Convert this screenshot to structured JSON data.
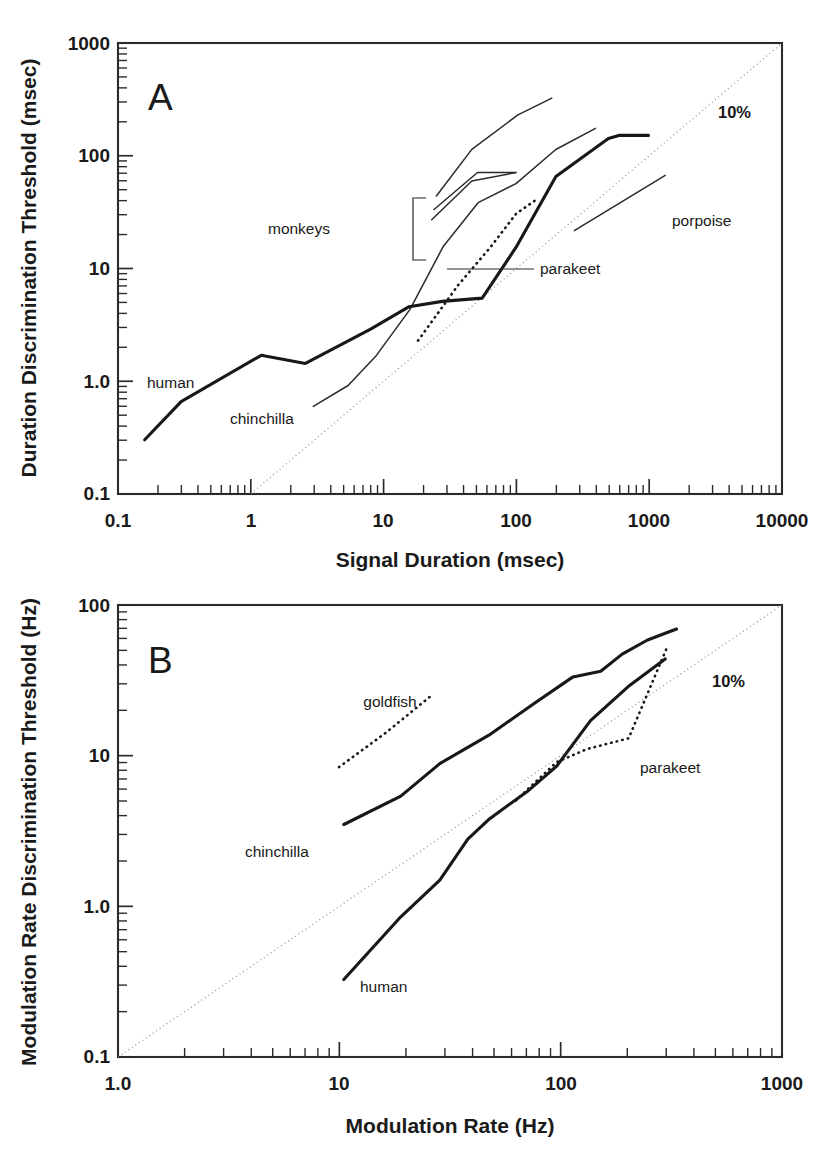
{
  "figure": {
    "name": "duration-and-modulation-rate-discrimination-figure",
    "background": "#ffffff",
    "ink_color": "#181818",
    "grid_color": "#909090"
  },
  "panels": [
    {
      "id": "A",
      "letter": "A",
      "pct_label": "10%"
    },
    {
      "id": "B",
      "letter": "B",
      "pct_label": "10%"
    }
  ],
  "chart_data": [
    {
      "type": "line",
      "id": "panel-a",
      "panel": "A",
      "title": "",
      "xlabel": "Signal Duration (msec)",
      "ylabel": "Duration Discrimination Threshold (msec)",
      "xscale": "log",
      "yscale": "log",
      "xlim": [
        0.1,
        10000
      ],
      "ylim": [
        0.1,
        1000
      ],
      "xticks": [
        0.1,
        1,
        10,
        100,
        1000,
        10000
      ],
      "xticklabels": [
        "0.1",
        "1",
        "10",
        "100",
        "1000",
        "10000"
      ],
      "yticks": [
        0.1,
        1.0,
        10,
        100,
        1000
      ],
      "yticklabels": [
        "0.1",
        "1.0",
        "10",
        "100",
        "1000"
      ],
      "grid": false,
      "legend": "inline-annotations",
      "reference_line": {
        "label": "10%",
        "description": "diagonal 10% Weber fraction reference line",
        "style": "dotted",
        "points": [
          [
            1,
            0.1
          ],
          [
            10000,
            1000
          ]
        ]
      },
      "series": [
        {
          "name": "human",
          "style": "solid-thick",
          "label": "human",
          "points": [
            [
              0.16,
              0.4
            ],
            [
              0.3,
              0.74
            ],
            [
              1.2,
              1.55
            ],
            [
              2.6,
              1.35
            ],
            [
              8,
              2.3
            ],
            [
              17,
              3.4
            ],
            [
              30,
              3.7
            ],
            [
              60,
              3.9
            ],
            [
              100,
              8.5
            ],
            [
              200,
              26
            ],
            [
              500,
              52
            ],
            [
              600,
              55
            ],
            [
              1000,
              55
            ]
          ]
        },
        {
          "name": "chinchilla",
          "style": "solid-thin",
          "label": "chinchilla",
          "points": [
            [
              3.0,
              0.66
            ],
            [
              5.5,
              0.95
            ],
            [
              9,
              1.6
            ],
            [
              17,
              3.4
            ],
            [
              30,
              9.0
            ],
            [
              55,
              22
            ],
            [
              100,
              31
            ],
            [
              200,
              62
            ],
            [
              400,
              95
            ]
          ]
        },
        {
          "name": "monkeys",
          "style": "solid-thin",
          "label": "monkeys",
          "description": "three monkey curves grouped by a bracket",
          "curves": [
            {
              "points": [
                [
                  26,
                  14
                ],
                [
                  55,
                  31
                ],
                [
                  100,
                  31
                ]
              ]
            },
            {
              "points": [
                [
                  25,
                  11.5
                ],
                [
                  50,
                  26
                ],
                [
                  100,
                  31
                ]
              ]
            },
            {
              "points": [
                [
                  27,
                  18
                ],
                [
                  50,
                  46
                ],
                [
                  110,
                  88
                ],
                [
                  200,
                  125
                ]
              ]
            }
          ]
        },
        {
          "name": "parakeet",
          "style": "dotted",
          "label": "parakeet",
          "points": [
            [
              20,
              2.4
            ],
            [
              40,
              6.5
            ],
            [
              70,
              14
            ],
            [
              110,
              25
            ],
            [
              160,
              34
            ]
          ]
        },
        {
          "name": "porpoise",
          "style": "solid-thin",
          "label": "porpoise",
          "points": [
            [
              310,
              17
            ],
            [
              1500,
              47
            ]
          ]
        }
      ],
      "annotations": [
        {
          "text": "human",
          "x": 0.55,
          "y": 1.15
        },
        {
          "text": "chinchilla",
          "x": 3.0,
          "y": 0.62
        },
        {
          "text": "monkeys",
          "x": 7.5,
          "y": 15
        },
        {
          "text": "parakeet",
          "x": 230,
          "y": 11
        },
        {
          "text": "porpoise",
          "x": 1400,
          "y": 22
        },
        {
          "text": "10%",
          "x": 2600,
          "y": 250
        }
      ]
    },
    {
      "type": "line",
      "id": "panel-b",
      "panel": "B",
      "title": "",
      "xlabel": "Modulation Rate (Hz)",
      "ylabel": "Modulation Rate Discrimination Threshold (Hz)",
      "xscale": "log",
      "yscale": "log",
      "xlim": [
        1.0,
        1000
      ],
      "ylim": [
        0.1,
        100
      ],
      "xticks": [
        1.0,
        10,
        100,
        1000
      ],
      "xticklabels": [
        "1.0",
        "10",
        "100",
        "1000"
      ],
      "yticks": [
        0.1,
        1.0,
        10,
        100
      ],
      "yticklabels": [
        "0.1",
        "1.0",
        "10",
        "100"
      ],
      "grid": false,
      "legend": "inline-annotations",
      "reference_line": {
        "label": "10%",
        "description": "diagonal 10% Weber fraction reference line",
        "style": "dotted",
        "points": [
          [
            1.0,
            0.1
          ],
          [
            1000,
            100
          ]
        ]
      },
      "series": [
        {
          "name": "chinchilla",
          "style": "solid-thick",
          "label": "chinchilla",
          "points": [
            [
              10.5,
              4.3
            ],
            [
              20,
              6.6
            ],
            [
              30,
              11
            ],
            [
              50,
              17
            ],
            [
              80,
              28
            ],
            [
              120,
              42
            ],
            [
              160,
              45
            ],
            [
              200,
              58
            ],
            [
              260,
              72
            ],
            [
              350,
              85
            ]
          ]
        },
        {
          "name": "human",
          "style": "solid-thick",
          "label": "human",
          "points": [
            [
              10.5,
              0.48
            ],
            [
              20,
              1.25
            ],
            [
              30,
              2.2
            ],
            [
              42,
              4.1
            ],
            [
              60,
              5.6
            ],
            [
              90,
              8.6
            ],
            [
              120,
              12.5
            ],
            [
              170,
              25
            ],
            [
              250,
              42
            ],
            [
              370,
              64
            ]
          ]
        },
        {
          "name": "goldfish",
          "style": "dotted",
          "label": "goldfish",
          "points": [
            [
              20,
              8.3
            ],
            [
              32,
              14
            ],
            [
              52,
              25
            ]
          ]
        },
        {
          "name": "parakeet",
          "style": "dotted",
          "label": "parakeet",
          "points": [
            [
              62,
              5.0
            ],
            [
              95,
              9.0
            ],
            [
              130,
              11
            ],
            [
              200,
              13
            ],
            [
              300,
              47
            ]
          ]
        }
      ],
      "annotations": [
        {
          "text": "goldfish",
          "x": 33,
          "y": 31
        },
        {
          "text": "chinchilla",
          "x": 12,
          "y": 3.0
        },
        {
          "text": "human",
          "x": 18,
          "y": 0.46
        },
        {
          "text": "parakeet",
          "x": 240,
          "y": 16
        },
        {
          "text": "10%",
          "x": 620,
          "y": 45
        }
      ]
    }
  ]
}
